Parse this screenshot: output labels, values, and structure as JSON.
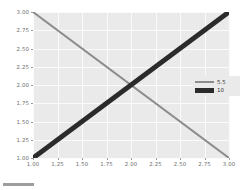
{
  "chart_data": {
    "type": "line",
    "title": "",
    "xlabel": "",
    "ylabel": "",
    "xlim": [
      1.0,
      3.0
    ],
    "ylim": [
      1.0,
      3.0
    ],
    "grid": true,
    "legend_position": "center-right",
    "xticks": [
      "1.00",
      "1.25",
      "1.50",
      "1.75",
      "2.00",
      "2.25",
      "2.50",
      "2.75",
      "3.00"
    ],
    "yticks": [
      "3.00",
      "2.75",
      "2.50",
      "2.25",
      "2.00",
      "1.75",
      "1.50",
      "1.25",
      "1.00"
    ],
    "xtick_values": [
      1.0,
      1.25,
      1.5,
      1.75,
      2.0,
      2.25,
      2.5,
      2.75,
      3.0
    ],
    "ytick_values": [
      3.0,
      2.75,
      2.5,
      2.25,
      2.0,
      1.75,
      1.5,
      1.25,
      1.0
    ],
    "series": [
      {
        "name": "5.5",
        "color": "#8c8c8c",
        "linewidth": 2,
        "x": [
          1.0,
          3.0
        ],
        "values": [
          3.0,
          1.0
        ]
      },
      {
        "name": "10",
        "color": "#2b2b2b",
        "linewidth": 5,
        "x": [
          1.0,
          3.0
        ],
        "values": [
          1.0,
          3.0
        ]
      }
    ],
    "intersection": [
      2.0,
      2.0
    ]
  },
  "legend": {
    "entries": [
      {
        "label": "5.5"
      },
      {
        "label": "10"
      }
    ]
  },
  "bottom_strip": {
    "label": ""
  },
  "colors": {
    "panel_background": "#eaeaea",
    "gridline": "#fbfbfb",
    "figure_background": "#ffffff",
    "tick_label": "#6e6e6e",
    "series_light": "#8c8c8c",
    "series_dark": "#2b2b2b"
  }
}
